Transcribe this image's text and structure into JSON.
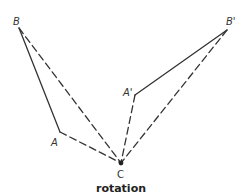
{
  "diagram": {
    "caption": "rotation",
    "colors": {
      "stroke": "#333333",
      "background": "#ffffff"
    },
    "points": {
      "B": {
        "label": "B",
        "x": 19,
        "y": 28
      },
      "A": {
        "label": "A",
        "x": 60,
        "y": 132
      },
      "C": {
        "label": "C",
        "x": 121,
        "y": 163
      },
      "A_prime": {
        "label": "A'",
        "x": 135,
        "y": 95
      },
      "B_prime": {
        "label": "B'",
        "x": 227,
        "y": 30
      }
    },
    "segments": [
      {
        "from": "B",
        "to": "A",
        "style": "solid"
      },
      {
        "from": "A_prime",
        "to": "B_prime",
        "style": "solid"
      },
      {
        "from": "B",
        "to": "C",
        "style": "dashed"
      },
      {
        "from": "A",
        "to": "C",
        "style": "dashed"
      },
      {
        "from": "A_prime",
        "to": "C",
        "style": "dashed"
      },
      {
        "from": "B_prime",
        "to": "C",
        "style": "dashed"
      }
    ]
  }
}
